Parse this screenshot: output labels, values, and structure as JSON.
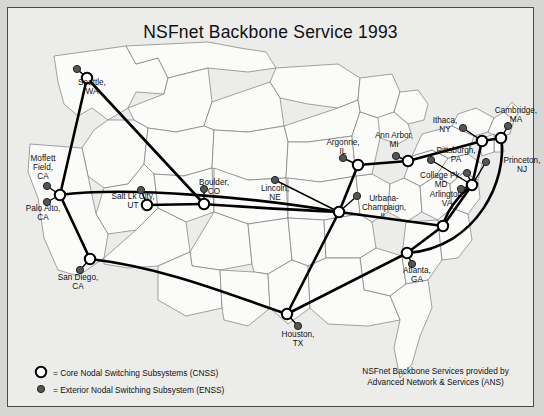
{
  "title": "NSFnet Backbone Service 1993",
  "colors": {
    "page_background": "#d6d6d4",
    "card_background": "#ececeb",
    "border": "#4a4a4a",
    "state_outline": "#6e6e6e",
    "trunk_line": "#000000",
    "node_fill": "#ffffff",
    "enss_fill": "#555555",
    "text": "#111111"
  },
  "legend": {
    "items": [
      {
        "marker": "hollow-circle",
        "text": "= Core Nodal Switching Subsystems (CNSS)"
      },
      {
        "marker": "filled-circle",
        "text": "= Exterior Nodal Switching Subsystem (ENSS)"
      }
    ]
  },
  "credit": {
    "line1": "NSFnet Backbone Services provided by",
    "line2": "Advanced Network & Services (ANS)"
  },
  "map": {
    "cnss_nodes": [
      {
        "name": "seattle-cnss",
        "x": 79,
        "y": 70
      },
      {
        "name": "palo-alto-cnss",
        "x": 52,
        "y": 187
      },
      {
        "name": "san-diego-cnss",
        "x": 82,
        "y": 251
      },
      {
        "name": "salt-lake-city-cnss",
        "x": 139,
        "y": 197
      },
      {
        "name": "boulder-cnss",
        "x": 196,
        "y": 196
      },
      {
        "name": "champaign-cnss",
        "x": 331,
        "y": 204
      },
      {
        "name": "argonne-cnss",
        "x": 350,
        "y": 157
      },
      {
        "name": "ann-arbor-cnss",
        "x": 400,
        "y": 153
      },
      {
        "name": "houston-cnss",
        "x": 279,
        "y": 306
      },
      {
        "name": "atlanta-cnss",
        "x": 399,
        "y": 245
      },
      {
        "name": "greensboro-cnss",
        "x": 435,
        "y": 218
      },
      {
        "name": "college-park-cnss",
        "x": 464,
        "y": 177
      },
      {
        "name": "ithaca-cnss",
        "x": 474,
        "y": 133
      },
      {
        "name": "cambridge-cnss",
        "x": 493,
        "y": 130
      }
    ],
    "enss_nodes": [
      {
        "name": "seattle-enss",
        "x": 69,
        "y": 61
      },
      {
        "name": "moffett-enss",
        "x": 39,
        "y": 178
      },
      {
        "name": "palo-alto-enss",
        "x": 39,
        "y": 194
      },
      {
        "name": "san-diego-enss",
        "x": 72,
        "y": 262
      },
      {
        "name": "salt-lake-enss",
        "x": 133,
        "y": 182
      },
      {
        "name": "boulder-enss",
        "x": 196,
        "y": 181
      },
      {
        "name": "lincoln-enss",
        "x": 267,
        "y": 172
      },
      {
        "name": "champaign-enss",
        "x": 349,
        "y": 188
      },
      {
        "name": "argonne-enss",
        "x": 335,
        "y": 150
      },
      {
        "name": "ann-arbor-enss",
        "x": 388,
        "y": 148
      },
      {
        "name": "ithaca-enss",
        "x": 455,
        "y": 120
      },
      {
        "name": "cambridge-enss",
        "x": 500,
        "y": 118
      },
      {
        "name": "pittsburgh-enss",
        "x": 423,
        "y": 152
      },
      {
        "name": "princeton-enss",
        "x": 478,
        "y": 154
      },
      {
        "name": "college-park-enss",
        "x": 459,
        "y": 165
      },
      {
        "name": "arlington-enss",
        "x": 453,
        "y": 181
      },
      {
        "name": "houston-enss",
        "x": 290,
        "y": 318
      },
      {
        "name": "atlanta-enss",
        "x": 404,
        "y": 256
      }
    ],
    "city_labels": [
      {
        "name": "label-seattle",
        "text": "Seattle,\nWA",
        "x": 62,
        "y": 70,
        "w": 44
      },
      {
        "name": "label-moffett-field",
        "text": "Moffett\nField,\nCA",
        "x": 12,
        "y": 146,
        "w": 46
      },
      {
        "name": "label-palo-alto",
        "text": "Palo Alto,\nCA",
        "x": 8,
        "y": 196,
        "w": 54
      },
      {
        "name": "label-san-diego",
        "text": "San Diego,\nCA",
        "x": 40,
        "y": 265,
        "w": 60
      },
      {
        "name": "label-salt-lake",
        "text": "Salt Lk City,\nUT",
        "x": 92,
        "y": 184,
        "w": 66
      },
      {
        "name": "label-boulder",
        "text": "Boulder,\nCO",
        "x": 180,
        "y": 170,
        "w": 52
      },
      {
        "name": "label-lincoln",
        "text": "Lincoln,\nNE",
        "x": 243,
        "y": 176,
        "w": 48
      },
      {
        "name": "label-argonne",
        "text": "Argonne,\nIL",
        "x": 310,
        "y": 130,
        "w": 50
      },
      {
        "name": "label-ann-arbor",
        "text": "Ann Arbor,\nMI",
        "x": 358,
        "y": 123,
        "w": 56
      },
      {
        "name": "label-champaign",
        "text": "Urbana-\nChampaign,\nIL",
        "x": 345,
        "y": 186,
        "w": 62
      },
      {
        "name": "label-ithaca",
        "text": "Ithaca,\nNY",
        "x": 415,
        "y": 108,
        "w": 44
      },
      {
        "name": "label-cambridge",
        "text": "Cambridge,\nMA",
        "x": 478,
        "y": 98,
        "w": 60
      },
      {
        "name": "label-pittsburgh",
        "text": "Pittsburgh,\nPA",
        "x": 420,
        "y": 138,
        "w": 56
      },
      {
        "name": "label-princeton",
        "text": "Princeton,\nNJ",
        "x": 487,
        "y": 148,
        "w": 54
      },
      {
        "name": "label-college-park",
        "text": "College Pk,\nMD",
        "x": 403,
        "y": 163,
        "w": 60
      },
      {
        "name": "label-arlington",
        "text": "Arlington,\nVA",
        "x": 412,
        "y": 182,
        "w": 54
      },
      {
        "name": "label-atlanta",
        "text": "Atlanta,\nGA",
        "x": 385,
        "y": 258,
        "w": 48
      },
      {
        "name": "label-houston",
        "text": "Houston,\nTX",
        "x": 265,
        "y": 322,
        "w": 50
      }
    ]
  }
}
